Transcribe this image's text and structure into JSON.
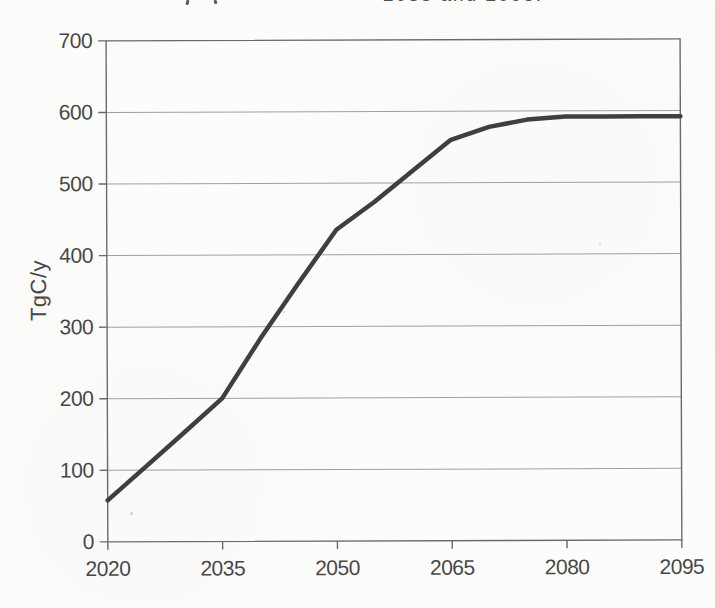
{
  "page": {
    "background": "#fcfcfb"
  },
  "title_fragment": {
    "text": "2035 and 2095."
  },
  "chart_data": {
    "type": "line",
    "title": "",
    "xlabel": "",
    "ylabel": "TgC/y",
    "xlim": [
      2020,
      2095
    ],
    "ylim": [
      0,
      700
    ],
    "xticks": [
      2020,
      2035,
      2050,
      2065,
      2080,
      2095
    ],
    "yticks": [
      0,
      100,
      200,
      300,
      400,
      500,
      600,
      700
    ],
    "grid": "horizontal",
    "legend": "none",
    "x": [
      2020,
      2025,
      2030,
      2035,
      2040,
      2045,
      2050,
      2055,
      2060,
      2065,
      2070,
      2075,
      2080,
      2085,
      2090,
      2095
    ],
    "series": [
      {
        "name": "TgC/y",
        "values": [
          58,
          105,
          152,
          200,
          283,
          360,
          435,
          474,
          517,
          560,
          578,
          588,
          592,
          592,
          592,
          592
        ]
      }
    ],
    "line_color": "#3f3f3f",
    "grid_color": "#a0a0a0",
    "axis_color": "#6a6a6a",
    "text_color": "#474747"
  }
}
